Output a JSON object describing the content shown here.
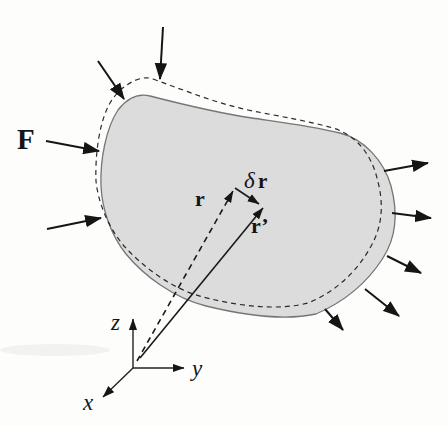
{
  "figure": {
    "name": "virtual-displacement-of-deformable-body",
    "colors": {
      "background": "#fdfdfc",
      "body_fill": "#dcdcdc",
      "body_stroke": "#767676",
      "ink": "#151515"
    },
    "labels": {
      "force": "F",
      "position_vector": "r",
      "delta_symbol": "δ",
      "delta_vector": "r",
      "displaced_vector": "r’",
      "axis_x": "x",
      "axis_y": "y",
      "axis_z": "z"
    }
  }
}
